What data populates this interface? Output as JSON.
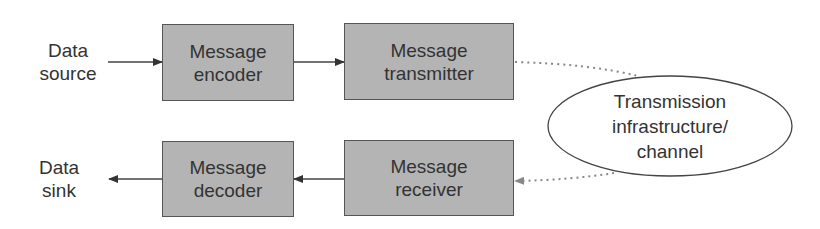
{
  "diagram": {
    "type": "communication-system-block-diagram",
    "endpoints": {
      "source": {
        "line1": "Data",
        "line2": "source"
      },
      "sink": {
        "line1": "Data",
        "line2": "sink"
      }
    },
    "blocks": {
      "encoder": {
        "line1": "Message",
        "line2": "encoder"
      },
      "transmitter": {
        "line1": "Message",
        "line2": "transmitter"
      },
      "receiver": {
        "line1": "Message",
        "line2": "receiver"
      },
      "decoder": {
        "line1": "Message",
        "line2": "decoder"
      }
    },
    "channel": {
      "line1": "Transmission",
      "line2": "infrastructure/",
      "line3": "channel"
    },
    "edges": [
      {
        "from": "Data source",
        "to": "Message encoder",
        "style": "solid"
      },
      {
        "from": "Message encoder",
        "to": "Message transmitter",
        "style": "solid"
      },
      {
        "from": "Message transmitter",
        "to": "Transmission infrastructure/channel",
        "style": "dotted"
      },
      {
        "from": "Transmission infrastructure/channel",
        "to": "Message receiver",
        "style": "dotted"
      },
      {
        "from": "Message receiver",
        "to": "Message decoder",
        "style": "solid"
      },
      {
        "from": "Message decoder",
        "to": "Data sink",
        "style": "solid"
      }
    ],
    "colors": {
      "block_fill": "#b4b4b4",
      "block_border": "#555555",
      "line": "#444444",
      "dotted": "#888888"
    }
  }
}
